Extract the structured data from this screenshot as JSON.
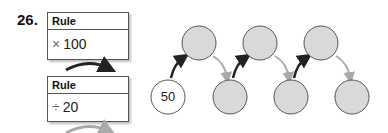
{
  "problem": {
    "number": "26.",
    "rules": [
      {
        "header": "Rule",
        "operator": "×",
        "operand": "100"
      },
      {
        "header": "Rule",
        "operator": "÷",
        "operand": "20"
      }
    ],
    "sequence": [
      {
        "value": "50",
        "filled": false
      },
      {
        "value": "",
        "filled": true
      },
      {
        "value": "",
        "filled": true
      },
      {
        "value": "",
        "filled": true
      },
      {
        "value": "",
        "filled": true
      },
      {
        "value": "",
        "filled": true
      },
      {
        "value": "",
        "filled": true
      }
    ],
    "colors": {
      "circle_fill": "#d9d9d9",
      "circle_stroke": "#555555",
      "multiply_arrow": "#222222",
      "divide_arrow": "#aaaaaa"
    }
  }
}
